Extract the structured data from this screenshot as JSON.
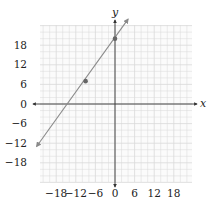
{
  "chart_data": {
    "type": "line",
    "title": "",
    "xlabel": "x",
    "ylabel": "y",
    "xlim": [
      -24,
      24
    ],
    "ylim": [
      -24,
      24
    ],
    "grid": true,
    "grid_minor_step": 2,
    "x_ticks": [
      -18,
      -12,
      -6,
      0,
      6,
      12,
      18
    ],
    "y_ticks": [
      18,
      12,
      6,
      0,
      -6,
      -12,
      -18
    ],
    "x_tick_labels": [
      "−18",
      "−12",
      "−6",
      "0",
      "6",
      "12",
      "18"
    ],
    "y_tick_labels": [
      "18",
      "12",
      "6",
      "0",
      "−6",
      "−12",
      "−18"
    ],
    "series": [
      {
        "name": "line",
        "type": "line",
        "x": [
          -24,
          4
        ],
        "y": [
          -13,
          26
        ],
        "arrows_both_ends": true,
        "color": "#8a8a8a"
      },
      {
        "name": "points",
        "type": "scatter",
        "x": [
          -9,
          0
        ],
        "y": [
          7,
          20
        ],
        "color": "#666666"
      }
    ],
    "legend": null
  },
  "colors": {
    "grid": "#d9d9d9",
    "axis": "#333333",
    "line": "#8a8a8a",
    "point": "#6a6a6a"
  }
}
